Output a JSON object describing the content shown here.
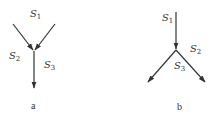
{
  "diagrams": [
    {
      "id": "a",
      "caption": "a",
      "description": "Two streams S1 (left branch, S2) merge into single outflow S3",
      "labels": {
        "s1": {
          "base": "S",
          "sub": "1"
        },
        "s2": {
          "base": "S",
          "sub": "2"
        },
        "s3": {
          "base": "S",
          "sub": "3"
        }
      }
    },
    {
      "id": "b",
      "caption": "b",
      "description": "Single inflow S1 splits into two outflows S2 and S3",
      "labels": {
        "s1": {
          "base": "S",
          "sub": "1"
        },
        "s2": {
          "base": "S",
          "sub": "2"
        },
        "s3": {
          "base": "S",
          "sub": "3"
        }
      }
    }
  ],
  "colors": {
    "line": "#333333",
    "background": "#ffffff"
  }
}
